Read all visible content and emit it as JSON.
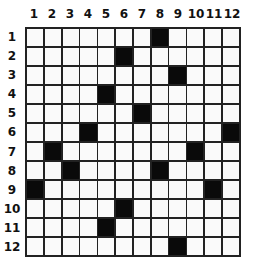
{
  "puzzle": {
    "columns": [
      "1",
      "2",
      "3",
      "4",
      "5",
      "6",
      "7",
      "8",
      "9",
      "10",
      "11",
      "12"
    ],
    "rows": [
      "1",
      "2",
      "3",
      "4",
      "5",
      "6",
      "7",
      "8",
      "9",
      "10",
      "11",
      "12"
    ],
    "black_cells": [
      [
        1,
        8
      ],
      [
        2,
        6
      ],
      [
        3,
        9
      ],
      [
        4,
        5
      ],
      [
        5,
        7
      ],
      [
        6,
        4
      ],
      [
        6,
        12
      ],
      [
        7,
        2
      ],
      [
        7,
        10
      ],
      [
        8,
        3
      ],
      [
        8,
        8
      ],
      [
        9,
        1
      ],
      [
        9,
        11
      ],
      [
        10,
        6
      ],
      [
        11,
        5
      ],
      [
        12,
        9
      ]
    ],
    "colors": {
      "filled": "#0a0a0a",
      "empty": "#fafafa",
      "grid_line": "#222222"
    }
  }
}
